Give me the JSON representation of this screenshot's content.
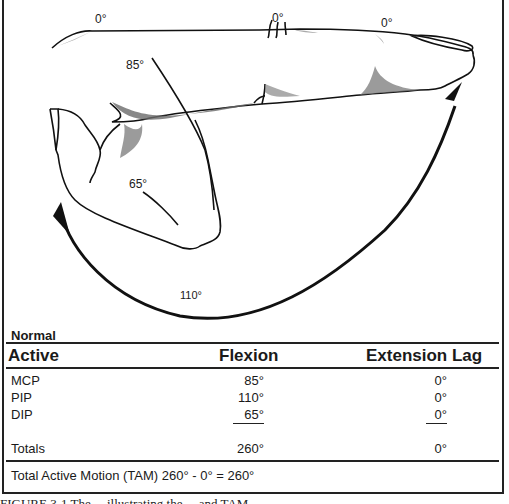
{
  "figure": {
    "angle_labels": {
      "mcp_extension": "0°",
      "pip_extension": "0°",
      "dip_extension": "0°",
      "mcp_flexion": "85°",
      "dip_flexion": "65°",
      "pip_flexion": "110°"
    }
  },
  "table": {
    "section_title": "Normal",
    "headers": {
      "active": "Active",
      "flexion": "Flexion",
      "extension_lag": "Extension Lag"
    },
    "rows": [
      {
        "joint": "MCP",
        "flexion": "85°",
        "extension_lag": "0°"
      },
      {
        "joint": "PIP",
        "flexion": "110°",
        "extension_lag": "0°"
      },
      {
        "joint": "DIP",
        "flexion": "65°",
        "extension_lag": "0°"
      }
    ],
    "totals": {
      "label": "Totals",
      "flexion": "260°",
      "extension_lag": "0°"
    },
    "tam_formula": "Total Active Motion (TAM) 260° - 0° = 260°"
  },
  "caption": "FIGURE 3-1 The ... illustrating the ... and TAM ..."
}
